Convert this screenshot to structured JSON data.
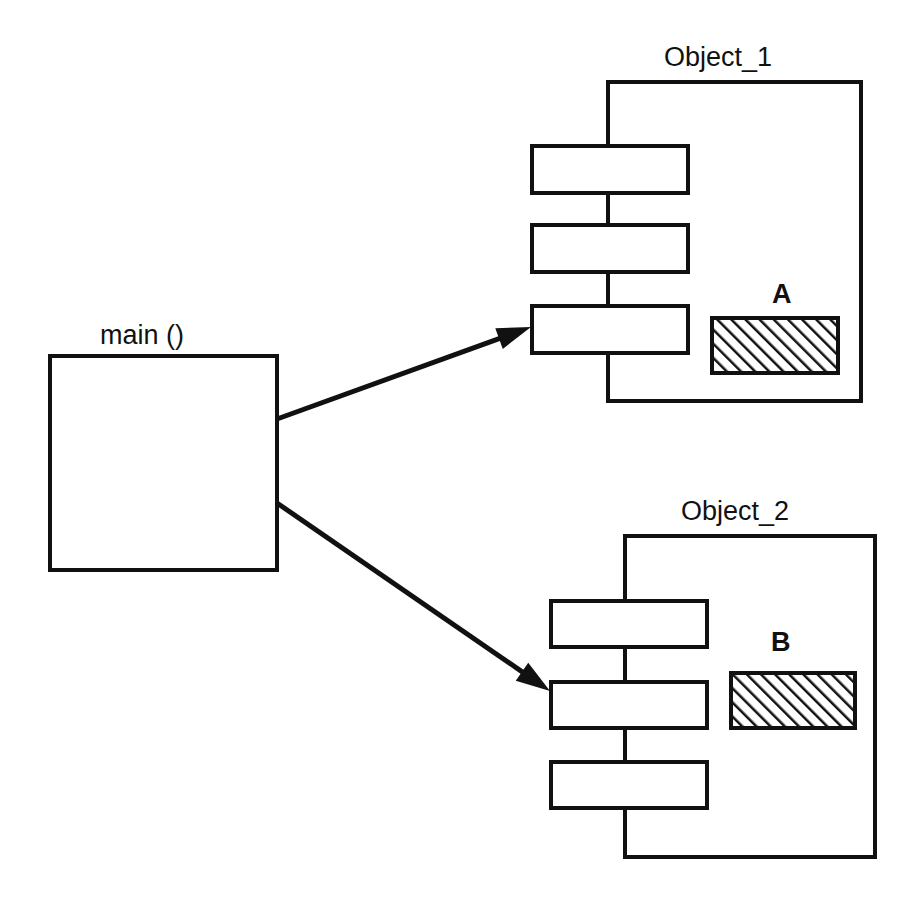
{
  "diagram": {
    "stroke_color": "#111111",
    "fill_color": "#ffffff",
    "hatch_color": "#111111",
    "background_color": "#ffffff",
    "caller": {
      "label": "main ()",
      "label_x": 100,
      "label_y": 322,
      "box": {
        "x": 50,
        "y": 356,
        "w": 227,
        "h": 214
      }
    },
    "objects": [
      {
        "id": "object-1",
        "title": "Object_1",
        "title_x": 664,
        "title_y": 44,
        "container": {
          "x": 608,
          "y": 82,
          "w": 253,
          "h": 319
        },
        "methods": [
          {
            "x": 532,
            "y": 146,
            "w": 156,
            "h": 47
          },
          {
            "x": 532,
            "y": 225,
            "w": 156,
            "h": 47
          },
          {
            "x": 532,
            "y": 306,
            "w": 156,
            "h": 47
          }
        ],
        "spine_x": 608,
        "memory": {
          "label": "A",
          "label_x": 772,
          "label_y": 281,
          "box": {
            "x": 712,
            "y": 318,
            "w": 126,
            "h": 55
          }
        }
      },
      {
        "id": "object-2",
        "title": "Object_2",
        "title_x": 681,
        "title_y": 498,
        "container": {
          "x": 625,
          "y": 536,
          "w": 250,
          "h": 321
        },
        "methods": [
          {
            "x": 551,
            "y": 601,
            "w": 156,
            "h": 46
          },
          {
            "x": 551,
            "y": 682,
            "w": 156,
            "h": 46
          },
          {
            "x": 551,
            "y": 762,
            "w": 156,
            "h": 46
          }
        ],
        "spine_x": 625,
        "memory": {
          "label": "B",
          "label_x": 771,
          "label_y": 629,
          "box": {
            "x": 731,
            "y": 673,
            "w": 124,
            "h": 55
          }
        }
      }
    ],
    "arrows": [
      {
        "id": "arrow-main-to-object-1",
        "from_x": 277,
        "from_y": 419,
        "to_x": 531,
        "to_y": 327
      },
      {
        "id": "arrow-main-to-object-2",
        "from_x": 277,
        "from_y": 503,
        "to_x": 550,
        "to_y": 691
      }
    ]
  }
}
